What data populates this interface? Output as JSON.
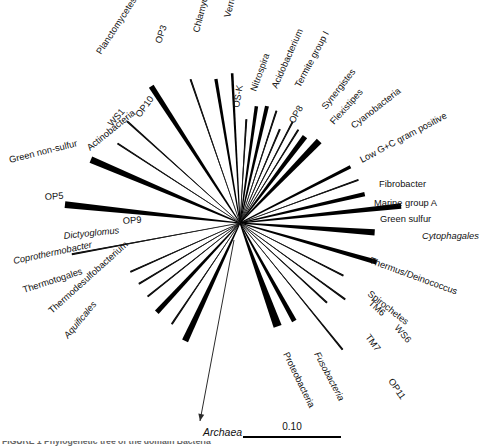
{
  "figure": {
    "type": "unrooted-phylogenetic-tree",
    "hub": {
      "x": 240,
      "y": 223
    },
    "outgroup": {
      "name": "Archaea",
      "label": "Archaea",
      "italic": true,
      "arrow_from": {
        "x": 234,
        "y": 240
      },
      "arrow_to": {
        "x": 200,
        "y": 421
      },
      "label_x": 203,
      "label_y": 436
    },
    "scale": {
      "value_label": "0.10",
      "x1": 243,
      "x2": 341,
      "y": 437,
      "label_x": 292,
      "label_y": 430
    },
    "caption": "FIGURE 1   Phylogenetic tree of the domain Bacteria"
  },
  "chart_data": {
    "type": "tree",
    "scale_bar": "0.10",
    "root_arrow": "Archaea",
    "branch_count": 36,
    "branches": [
      {
        "label": "Planctomycetes",
        "angle": 237.0,
        "length": 163,
        "width": 5.6,
        "italic": false,
        "label_rot": -57,
        "lx": 101,
        "ly": 55,
        "anchor": "start"
      },
      {
        "label": "OP3",
        "angle": 251.0,
        "length": 152,
        "width": 1.1,
        "italic": false,
        "label_rot": -72,
        "lx": 161,
        "ly": 44,
        "anchor": "start"
      },
      {
        "label": "Chlamydia",
        "angle": 260.5,
        "length": 146,
        "width": 3.3,
        "italic": false,
        "label_rot": -76,
        "lx": 199,
        "ly": 33,
        "anchor": "start"
      },
      {
        "label": "Verrucomicrobia",
        "angle": 267.0,
        "length": 150,
        "width": 2.6,
        "italic": false,
        "label_rot": -76,
        "lx": 230,
        "ly": 18,
        "anchor": "start"
      },
      {
        "label": "OS-K",
        "angle": 273.5,
        "length": 104,
        "width": 1.2,
        "italic": false,
        "label_rot": -80,
        "lx": 239,
        "ly": 108,
        "anchor": "start"
      },
      {
        "label": "Nitrospira",
        "angle": 278.0,
        "length": 118,
        "width": 3.5,
        "italic": false,
        "label_rot": -70,
        "lx": 256,
        "ly": 92,
        "anchor": "start"
      },
      {
        "label": "Acidobacterium",
        "angle": 283.0,
        "length": 120,
        "width": 4.0,
        "italic": false,
        "label_rot": -66,
        "lx": 277,
        "ly": 89,
        "anchor": "start"
      },
      {
        "label": "Termite group I",
        "angle": 288.0,
        "length": 118,
        "width": 1.3,
        "italic": false,
        "label_rot": -62,
        "lx": 300,
        "ly": 88,
        "anchor": "start"
      },
      {
        "label": "OP8",
        "angle": 293.0,
        "length": 102,
        "width": 1.2,
        "italic": false,
        "label_rot": -60,
        "lx": 294,
        "ly": 124,
        "anchor": "start"
      },
      {
        "label": "Synergistes",
        "angle": 297.5,
        "length": 114,
        "width": 1.4,
        "italic": false,
        "label_rot": -52,
        "lx": 326,
        "ly": 110,
        "anchor": "start"
      },
      {
        "label": "Flexistipes",
        "angle": 302.0,
        "length": 110,
        "width": 1.5,
        "italic": false,
        "label_rot": -48,
        "lx": 334,
        "ly": 125,
        "anchor": "start"
      },
      {
        "label": "Cyanobacteria",
        "angle": 307.0,
        "length": 108,
        "width": 5.4,
        "italic": false,
        "label_rot": -38,
        "lx": 354,
        "ly": 129,
        "anchor": "start"
      },
      {
        "label": "Low G+C gram positive",
        "angle": 314.0,
        "length": 114,
        "width": 6.6,
        "italic": false,
        "label_rot": -28,
        "lx": 362,
        "ly": 163,
        "anchor": "start"
      },
      {
        "label": "Fibrobacter",
        "angle": 333.0,
        "length": 124,
        "width": 3.4,
        "italic": false,
        "label_rot": 0,
        "lx": 379,
        "ly": 187,
        "anchor": "start"
      },
      {
        "label": "Marine group A",
        "angle": 340.0,
        "length": 126,
        "width": 1.4,
        "italic": false,
        "label_rot": 0,
        "lx": 374,
        "ly": 206,
        "anchor": "start"
      },
      {
        "label": "Green sulfur",
        "angle": 347.0,
        "length": 128,
        "width": 4.3,
        "italic": false,
        "label_rot": 0,
        "lx": 380,
        "ly": 222,
        "anchor": "start"
      },
      {
        "label": "Cytophagales",
        "angle": 354.0,
        "length": 162,
        "width": 5.6,
        "italic": true,
        "label_rot": 0,
        "lx": 422,
        "ly": 239,
        "anchor": "start"
      },
      {
        "label": "Thermus/Deinococcus",
        "angle": 4.0,
        "length": 135,
        "width": 6.1,
        "italic": false,
        "label_rot": 20,
        "lx": 369,
        "ly": 263,
        "anchor": "start"
      },
      {
        "label": "Spirochetes",
        "angle": 16.0,
        "length": 142,
        "width": 5.0,
        "italic": false,
        "label_rot": 38,
        "lx": 367,
        "ly": 295,
        "anchor": "start"
      },
      {
        "label": "TM6",
        "angle": 27.0,
        "length": 116,
        "width": 1.3,
        "italic": false,
        "label_rot": 42,
        "lx": 368,
        "ly": 304,
        "anchor": "start"
      },
      {
        "label": "WS6",
        "angle": 36.0,
        "length": 130,
        "width": 1.2,
        "italic": false,
        "label_rot": 50,
        "lx": 394,
        "ly": 328,
        "anchor": "start"
      },
      {
        "label": "TM7",
        "angle": 42.5,
        "length": 118,
        "width": 1.2,
        "italic": false,
        "label_rot": 54,
        "lx": 365,
        "ly": 337,
        "anchor": "start"
      },
      {
        "label": "OP11",
        "angle": 51.0,
        "length": 163,
        "width": 1.1,
        "italic": false,
        "label_rot": 56,
        "lx": 388,
        "ly": 381,
        "anchor": "start"
      },
      {
        "label": "Fusobacteria",
        "angle": 61.0,
        "length": 112,
        "width": 5.0,
        "italic": true,
        "label_rot": 62,
        "lx": 314,
        "ly": 354,
        "anchor": "start"
      },
      {
        "label": "Proteobacteria",
        "angle": 70.0,
        "length": 110,
        "width": 8.4,
        "italic": false,
        "label_rot": 64,
        "lx": 283,
        "ly": 354,
        "anchor": "start"
      },
      {
        "label": "Aquificales",
        "angle": 115.0,
        "length": 130,
        "width": 6.5,
        "italic": true,
        "label_rot": -50,
        "lx": 68,
        "ly": 339,
        "anchor": "start"
      },
      {
        "label": "Thermodesulfobacterium",
        "angle": 124.0,
        "length": 122,
        "width": 1.4,
        "italic": false,
        "label_rot": -42,
        "lx": 52,
        "ly": 314,
        "anchor": "start"
      },
      {
        "label": "Thermotogales",
        "angle": 133.0,
        "length": 122,
        "width": 5.0,
        "italic": false,
        "label_rot": -18,
        "lx": 24,
        "ly": 293,
        "anchor": "start"
      },
      {
        "label": "Coprothermobacter",
        "angle": 141.5,
        "length": 118,
        "width": 1.2,
        "italic": true,
        "label_rot": -12,
        "lx": 14,
        "ly": 264,
        "anchor": "start"
      },
      {
        "label": "Dictyoglomus",
        "angle": 149.0,
        "length": 118,
        "width": 1.2,
        "italic": true,
        "label_rot": -6,
        "lx": 64,
        "ly": 239,
        "anchor": "start"
      },
      {
        "label": "OP9",
        "angle": 156.0,
        "length": 120,
        "width": 1.2,
        "italic": false,
        "label_rot": -4,
        "lx": 123,
        "ly": 224,
        "anchor": "start"
      },
      {
        "label": "OP5",
        "angle": 169.5,
        "length": 171,
        "width": 1.3,
        "italic": false,
        "label_rot": -4,
        "lx": 45,
        "ly": 200,
        "anchor": "start"
      },
      {
        "label": "Green non-sulfur",
        "angle": 186.0,
        "length": 176,
        "width": 6.6,
        "italic": false,
        "label_rot": -14,
        "lx": 10,
        "ly": 163,
        "anchor": "start"
      },
      {
        "label": "Actinobacteria",
        "angle": 203.0,
        "length": 162,
        "width": 6.8,
        "italic": false,
        "label_rot": -39,
        "lx": 90,
        "ly": 151,
        "anchor": "start"
      },
      {
        "label": "WS1",
        "angle": 213.0,
        "length": 146,
        "width": 1.2,
        "italic": false,
        "label_rot": -49,
        "lx": 112,
        "ly": 127,
        "anchor": "start"
      },
      {
        "label": "OP10",
        "angle": 222.0,
        "length": 152,
        "width": 1.2,
        "italic": false,
        "label_rot": -54,
        "lx": 140,
        "ly": 118,
        "anchor": "start"
      }
    ]
  }
}
